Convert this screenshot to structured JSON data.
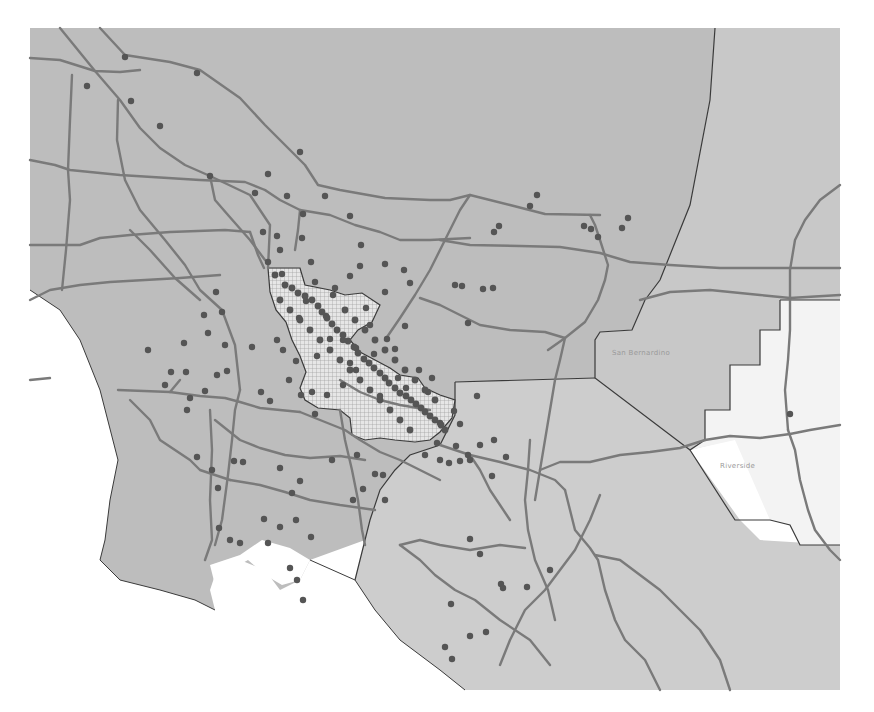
{
  "map": {
    "width": 874,
    "height": 712,
    "colors": {
      "background": "#ffffff",
      "land_primary": "#bdbdbd",
      "land_secondary": "#c8c8c8",
      "land_light": "#d4d4d4",
      "land_white": "#f3f3f3",
      "highway": "#7a7a7a",
      "boundary": "#3a3a3a",
      "point": "#555555",
      "hatch_fill": "#e6e6e6",
      "hatch_line": "#9a9a9a"
    },
    "labels": {
      "county_a": "San Bernardino",
      "county_b": "Riverside"
    },
    "labels_note": "Both labels are illegible at screenshot resolution; the names are inferred from the apparent geography and have not been read off the image.",
    "points": [
      [
        125,
        57
      ],
      [
        197,
        73
      ],
      [
        87,
        86
      ],
      [
        131,
        101
      ],
      [
        160,
        126
      ],
      [
        210,
        176
      ],
      [
        255,
        193
      ],
      [
        300,
        152
      ],
      [
        268,
        174
      ],
      [
        287,
        196
      ],
      [
        325,
        196
      ],
      [
        303,
        214
      ],
      [
        280,
        250
      ],
      [
        263,
        232
      ],
      [
        302,
        238
      ],
      [
        277,
        236
      ],
      [
        268,
        262
      ],
      [
        311,
        262
      ],
      [
        282,
        274
      ],
      [
        315,
        282
      ],
      [
        335,
        288
      ],
      [
        350,
        276
      ],
      [
        360,
        266
      ],
      [
        385,
        292
      ],
      [
        361,
        245
      ],
      [
        350,
        216
      ],
      [
        385,
        264
      ],
      [
        404,
        270
      ],
      [
        410,
        283
      ],
      [
        326,
        316
      ],
      [
        333,
        295
      ],
      [
        306,
        301
      ],
      [
        299,
        318
      ],
      [
        283,
        350
      ],
      [
        289,
        380
      ],
      [
        301,
        395
      ],
      [
        312,
        392
      ],
      [
        277,
        340
      ],
      [
        296,
        361
      ],
      [
        252,
        347
      ],
      [
        261,
        392
      ],
      [
        270,
        401
      ],
      [
        315,
        414
      ],
      [
        327,
        395
      ],
      [
        343,
        385
      ],
      [
        350,
        363
      ],
      [
        356,
        370
      ],
      [
        380,
        396
      ],
      [
        398,
        378
      ],
      [
        406,
        388
      ],
      [
        419,
        370
      ],
      [
        432,
        378
      ],
      [
        428,
        392
      ],
      [
        454,
        411
      ],
      [
        460,
        424
      ],
      [
        477,
        396
      ],
      [
        494,
        440
      ],
      [
        480,
        445
      ],
      [
        468,
        455
      ],
      [
        470,
        460
      ],
      [
        460,
        461
      ],
      [
        449,
        463
      ],
      [
        437,
        443
      ],
      [
        456,
        446
      ],
      [
        440,
        423
      ],
      [
        499,
        226
      ],
      [
        494,
        232
      ],
      [
        537,
        195
      ],
      [
        530,
        206
      ],
      [
        584,
        226
      ],
      [
        591,
        229
      ],
      [
        598,
        237
      ],
      [
        628,
        218
      ],
      [
        622,
        228
      ],
      [
        455,
        285
      ],
      [
        462,
        286
      ],
      [
        493,
        288
      ],
      [
        483,
        289
      ],
      [
        468,
        323
      ],
      [
        405,
        326
      ],
      [
        366,
        308
      ],
      [
        343,
        340
      ],
      [
        356,
        348
      ],
      [
        374,
        354
      ],
      [
        387,
        339
      ],
      [
        395,
        349
      ],
      [
        370,
        325
      ],
      [
        330,
        339
      ],
      [
        317,
        356
      ],
      [
        222,
        312
      ],
      [
        225,
        345
      ],
      [
        208,
        333
      ],
      [
        227,
        371
      ],
      [
        217,
        375
      ],
      [
        184,
        343
      ],
      [
        186,
        372
      ],
      [
        205,
        391
      ],
      [
        165,
        385
      ],
      [
        190,
        398
      ],
      [
        187,
        410
      ],
      [
        171,
        372
      ],
      [
        148,
        350
      ],
      [
        204,
        315
      ],
      [
        216,
        292
      ],
      [
        197,
        457
      ],
      [
        212,
        470
      ],
      [
        218,
        488
      ],
      [
        234,
        461
      ],
      [
        243,
        462
      ],
      [
        280,
        468
      ],
      [
        300,
        481
      ],
      [
        292,
        493
      ],
      [
        357,
        455
      ],
      [
        332,
        460
      ],
      [
        383,
        475
      ],
      [
        385,
        500
      ],
      [
        353,
        500
      ],
      [
        375,
        474
      ],
      [
        363,
        489
      ],
      [
        425,
        455
      ],
      [
        440,
        460
      ],
      [
        492,
        476
      ],
      [
        506,
        457
      ],
      [
        264,
        519
      ],
      [
        268,
        543
      ],
      [
        280,
        527
      ],
      [
        296,
        520
      ],
      [
        219,
        528
      ],
      [
        230,
        540
      ],
      [
        240,
        543
      ],
      [
        311,
        537
      ],
      [
        290,
        568
      ],
      [
        297,
        580
      ],
      [
        303,
        600
      ],
      [
        470,
        539
      ],
      [
        480,
        554
      ],
      [
        501,
        584
      ],
      [
        503,
        588
      ],
      [
        527,
        587
      ],
      [
        451,
        604
      ],
      [
        470,
        636
      ],
      [
        486,
        632
      ],
      [
        445,
        647
      ],
      [
        452,
        659
      ],
      [
        550,
        570
      ],
      [
        790,
        414
      ]
    ],
    "cluster_points": [
      [
        275,
        275
      ],
      [
        285,
        285
      ],
      [
        292,
        288
      ],
      [
        298,
        293
      ],
      [
        305,
        296
      ],
      [
        312,
        300
      ],
      [
        318,
        306
      ],
      [
        322,
        312
      ],
      [
        327,
        318
      ],
      [
        332,
        324
      ],
      [
        337,
        330
      ],
      [
        343,
        335
      ],
      [
        348,
        341
      ],
      [
        354,
        347
      ],
      [
        358,
        353
      ],
      [
        364,
        359
      ],
      [
        369,
        363
      ],
      [
        374,
        368
      ],
      [
        380,
        373
      ],
      [
        385,
        378
      ],
      [
        389,
        383
      ],
      [
        395,
        388
      ],
      [
        400,
        393
      ],
      [
        406,
        396
      ],
      [
        411,
        400
      ],
      [
        416,
        404
      ],
      [
        421,
        408
      ],
      [
        425,
        412
      ],
      [
        430,
        416
      ],
      [
        435,
        420
      ],
      [
        441,
        425
      ],
      [
        445,
        430
      ],
      [
        280,
        300
      ],
      [
        290,
        310
      ],
      [
        300,
        320
      ],
      [
        310,
        330
      ],
      [
        320,
        340
      ],
      [
        330,
        350
      ],
      [
        340,
        360
      ],
      [
        350,
        370
      ],
      [
        360,
        380
      ],
      [
        370,
        390
      ],
      [
        380,
        400
      ],
      [
        390,
        410
      ],
      [
        400,
        420
      ],
      [
        410,
        430
      ],
      [
        345,
        310
      ],
      [
        355,
        320
      ],
      [
        365,
        330
      ],
      [
        375,
        340
      ],
      [
        385,
        350
      ],
      [
        395,
        360
      ],
      [
        405,
        370
      ],
      [
        415,
        380
      ],
      [
        425,
        390
      ],
      [
        435,
        400
      ]
    ]
  }
}
